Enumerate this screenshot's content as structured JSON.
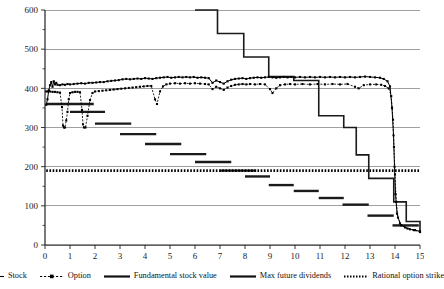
{
  "chart_data": {
    "type": "line",
    "title": "",
    "xlabel": "",
    "ylabel": "",
    "xlim": [
      0,
      15
    ],
    "ylim": [
      0,
      600
    ],
    "grid": true,
    "x_ticks": [
      0,
      1,
      2,
      3,
      4,
      5,
      6,
      7,
      8,
      9,
      10,
      11,
      12,
      13,
      14,
      15
    ],
    "x_tick_labels": [
      "0",
      "1",
      "2",
      "3",
      "4",
      "5",
      "6",
      "7",
      "8",
      "9",
      "10",
      "11",
      "12",
      "13",
      "14",
      "15"
    ],
    "y_ticks": [
      0,
      100,
      200,
      300,
      400,
      500,
      600
    ],
    "y_tick_labels": [
      "0",
      "100",
      "200",
      "300",
      "400",
      "500",
      "600"
    ],
    "y_minor_ticks": [
      50,
      150,
      250,
      350,
      450,
      550
    ],
    "legend_position": "below",
    "series": [
      {
        "name": "Stock",
        "style": "solid-with-markers",
        "color": "#000000",
        "points": [
          [
            0.05,
            358
          ],
          [
            0.1,
            372
          ],
          [
            0.15,
            395
          ],
          [
            0.2,
            408
          ],
          [
            0.25,
            416
          ],
          [
            0.3,
            404
          ],
          [
            0.35,
            418
          ],
          [
            0.4,
            410
          ],
          [
            0.45,
            414
          ],
          [
            0.5,
            409
          ],
          [
            0.6,
            408
          ],
          [
            0.7,
            410
          ],
          [
            0.8,
            409
          ],
          [
            0.9,
            411
          ],
          [
            1.0,
            410
          ],
          [
            1.15,
            411
          ],
          [
            1.3,
            412
          ],
          [
            1.45,
            413
          ],
          [
            1.6,
            412
          ],
          [
            1.75,
            414
          ],
          [
            1.9,
            414
          ],
          [
            2.05,
            415
          ],
          [
            2.2,
            416
          ],
          [
            2.35,
            416
          ],
          [
            2.5,
            418
          ],
          [
            2.65,
            419
          ],
          [
            2.8,
            420
          ],
          [
            2.95,
            421
          ],
          [
            3.1,
            423
          ],
          [
            3.25,
            424
          ],
          [
            3.4,
            423
          ],
          [
            3.55,
            424
          ],
          [
            3.7,
            425
          ],
          [
            3.85,
            424
          ],
          [
            4.0,
            426
          ],
          [
            4.15,
            425
          ],
          [
            4.3,
            424
          ],
          [
            4.45,
            426
          ],
          [
            4.6,
            427
          ],
          [
            4.75,
            428
          ],
          [
            4.9,
            429
          ],
          [
            5.05,
            427
          ],
          [
            5.2,
            428
          ],
          [
            5.35,
            429
          ],
          [
            5.5,
            428
          ],
          [
            5.65,
            429
          ],
          [
            5.8,
            428
          ],
          [
            5.95,
            429
          ],
          [
            6.1,
            427
          ],
          [
            6.25,
            428
          ],
          [
            6.4,
            427
          ],
          [
            6.55,
            426
          ],
          [
            6.7,
            414
          ],
          [
            6.85,
            420
          ],
          [
            7.0,
            416
          ],
          [
            7.15,
            412
          ],
          [
            7.3,
            418
          ],
          [
            7.45,
            422
          ],
          [
            7.6,
            424
          ],
          [
            7.75,
            425
          ],
          [
            7.9,
            426
          ],
          [
            8.05,
            424
          ],
          [
            8.2,
            426
          ],
          [
            8.35,
            427
          ],
          [
            8.5,
            428
          ],
          [
            8.65,
            427
          ],
          [
            8.8,
            428
          ],
          [
            8.95,
            429
          ],
          [
            9.1,
            428
          ],
          [
            9.25,
            427
          ],
          [
            9.4,
            428
          ],
          [
            9.55,
            429
          ],
          [
            9.7,
            428
          ],
          [
            9.85,
            429
          ],
          [
            10.0,
            428
          ],
          [
            10.2,
            429
          ],
          [
            10.4,
            428
          ],
          [
            10.6,
            429
          ],
          [
            10.8,
            428
          ],
          [
            11.0,
            429
          ],
          [
            11.2,
            428
          ],
          [
            11.4,
            429
          ],
          [
            11.6,
            428
          ],
          [
            11.8,
            429
          ],
          [
            12.0,
            428
          ],
          [
            12.2,
            429
          ],
          [
            12.4,
            428
          ],
          [
            12.6,
            429
          ],
          [
            12.8,
            430
          ],
          [
            13.0,
            429
          ],
          [
            13.2,
            428
          ],
          [
            13.4,
            427
          ],
          [
            13.55,
            424
          ],
          [
            13.7,
            418
          ],
          [
            13.8,
            405
          ],
          [
            13.88,
            350
          ],
          [
            13.94,
            280
          ],
          [
            13.98,
            200
          ],
          [
            14.02,
            130
          ],
          [
            14.08,
            80
          ],
          [
            14.2,
            55
          ],
          [
            14.4,
            45
          ],
          [
            14.6,
            40
          ],
          [
            14.8,
            38
          ],
          [
            15.0,
            35
          ]
        ]
      },
      {
        "name": "Option",
        "style": "dashed-with-markers",
        "color": "#000000",
        "points": [
          [
            0.05,
            392
          ],
          [
            0.12,
            392
          ],
          [
            0.2,
            392
          ],
          [
            0.3,
            391
          ],
          [
            0.4,
            391
          ],
          [
            0.5,
            390
          ],
          [
            0.6,
            389
          ],
          [
            0.68,
            352
          ],
          [
            0.72,
            305
          ],
          [
            0.76,
            300
          ],
          [
            0.8,
            300
          ],
          [
            0.85,
            318
          ],
          [
            0.9,
            340
          ],
          [
            0.95,
            372
          ],
          [
            1.0,
            388
          ],
          [
            1.1,
            390
          ],
          [
            1.2,
            391
          ],
          [
            1.3,
            391
          ],
          [
            1.4,
            390
          ],
          [
            1.48,
            345
          ],
          [
            1.52,
            308
          ],
          [
            1.56,
            300
          ],
          [
            1.62,
            300
          ],
          [
            1.7,
            330
          ],
          [
            1.8,
            370
          ],
          [
            1.9,
            388
          ],
          [
            2.0,
            392
          ],
          [
            2.15,
            393
          ],
          [
            2.3,
            394
          ],
          [
            2.45,
            395
          ],
          [
            2.6,
            396
          ],
          [
            2.75,
            397
          ],
          [
            2.9,
            398
          ],
          [
            3.05,
            399
          ],
          [
            3.2,
            400
          ],
          [
            3.35,
            401
          ],
          [
            3.5,
            402
          ],
          [
            3.65,
            403
          ],
          [
            3.8,
            404
          ],
          [
            3.95,
            405
          ],
          [
            4.1,
            406
          ],
          [
            4.25,
            406
          ],
          [
            4.4,
            372
          ],
          [
            4.48,
            360
          ],
          [
            4.6,
            392
          ],
          [
            4.72,
            405
          ],
          [
            4.85,
            410
          ],
          [
            5.0,
            412
          ],
          [
            5.2,
            413
          ],
          [
            5.4,
            412
          ],
          [
            5.6,
            413
          ],
          [
            5.8,
            412
          ],
          [
            6.0,
            413
          ],
          [
            6.2,
            412
          ],
          [
            6.4,
            411
          ],
          [
            6.55,
            410
          ],
          [
            6.7,
            398
          ],
          [
            6.85,
            404
          ],
          [
            7.0,
            400
          ],
          [
            7.15,
            396
          ],
          [
            7.3,
            402
          ],
          [
            7.45,
            406
          ],
          [
            7.6,
            409
          ],
          [
            7.75,
            410
          ],
          [
            7.9,
            411
          ],
          [
            8.05,
            410
          ],
          [
            8.2,
            411
          ],
          [
            8.4,
            410
          ],
          [
            8.6,
            411
          ],
          [
            8.8,
            410
          ],
          [
            9.0,
            398
          ],
          [
            9.1,
            388
          ],
          [
            9.25,
            400
          ],
          [
            9.4,
            408
          ],
          [
            9.6,
            410
          ],
          [
            9.8,
            411
          ],
          [
            10.0,
            410
          ],
          [
            10.3,
            411
          ],
          [
            10.6,
            410
          ],
          [
            10.9,
            411
          ],
          [
            11.2,
            410
          ],
          [
            11.5,
            411
          ],
          [
            11.8,
            410
          ],
          [
            12.1,
            411
          ],
          [
            12.4,
            404
          ],
          [
            12.55,
            400
          ],
          [
            12.75,
            408
          ],
          [
            13.0,
            410
          ],
          [
            13.25,
            410
          ],
          [
            13.45,
            409
          ],
          [
            13.6,
            406
          ],
          [
            13.75,
            400
          ],
          [
            13.85,
            380
          ],
          [
            13.92,
            320
          ],
          [
            13.96,
            250
          ],
          [
            14.0,
            180
          ],
          [
            14.05,
            110
          ],
          [
            14.12,
            70
          ],
          [
            14.25,
            50
          ],
          [
            14.5,
            42
          ],
          [
            14.75,
            38
          ],
          [
            15.0,
            33
          ]
        ]
      }
    ],
    "step_series": {
      "name": "Fundamental stock value",
      "style": "solid-step",
      "color": "#1a1a1a",
      "steps": [
        [
          6.0,
          600
        ],
        [
          6.9,
          600
        ],
        [
          6.9,
          540
        ],
        [
          7.95,
          540
        ],
        [
          7.95,
          480
        ],
        [
          8.95,
          480
        ],
        [
          8.95,
          430
        ],
        [
          9.95,
          430
        ],
        [
          9.95,
          420
        ],
        [
          10.95,
          420
        ],
        [
          10.95,
          330
        ],
        [
          11.95,
          330
        ],
        [
          11.95,
          300
        ],
        [
          12.45,
          300
        ],
        [
          12.45,
          230
        ],
        [
          12.95,
          230
        ],
        [
          12.95,
          170
        ],
        [
          13.95,
          170
        ],
        [
          13.95,
          110
        ],
        [
          14.45,
          110
        ],
        [
          14.45,
          60
        ],
        [
          15.0,
          60
        ],
        [
          15.0,
          35
        ]
      ]
    },
    "dividend_bars": {
      "name": "Max future dividends",
      "style": "horizontal-segments",
      "color": "#1a1a1a",
      "segments": [
        {
          "x0": 0.05,
          "x1": 1.95,
          "y": 360
        },
        {
          "x0": 1.0,
          "x1": 2.4,
          "y": 340
        },
        {
          "x0": 2.0,
          "x1": 3.45,
          "y": 310
        },
        {
          "x0": 3.0,
          "x1": 4.45,
          "y": 283
        },
        {
          "x0": 4.0,
          "x1": 5.45,
          "y": 258
        },
        {
          "x0": 5.0,
          "x1": 6.45,
          "y": 232
        },
        {
          "x0": 6.0,
          "x1": 7.45,
          "y": 212
        },
        {
          "x0": 7.0,
          "x1": 8.45,
          "y": 190
        },
        {
          "x0": 8.0,
          "x1": 9.0,
          "y": 175
        },
        {
          "x0": 8.95,
          "x1": 9.95,
          "y": 153
        },
        {
          "x0": 9.95,
          "x1": 10.95,
          "y": 138
        },
        {
          "x0": 10.95,
          "x1": 11.95,
          "y": 120
        },
        {
          "x0": 11.9,
          "x1": 12.95,
          "y": 103
        },
        {
          "x0": 12.9,
          "x1": 13.95,
          "y": 75
        },
        {
          "x0": 13.9,
          "x1": 14.95,
          "y": 50
        }
      ]
    },
    "strike_line": {
      "name": "Rational option strike",
      "style": "dotted",
      "color": "#000000",
      "y": 190,
      "x0": 0.05,
      "x1": 15.0
    }
  },
  "legend": {
    "items": [
      {
        "label": "Stock",
        "marker": "solid-line-with-square-marker"
      },
      {
        "label": "Option",
        "marker": "dashed-line-with-square-marker"
      },
      {
        "label": "Fundamental stock value",
        "marker": "thick-solid-line"
      },
      {
        "label": "Max future dividends",
        "marker": "thick-solid-line"
      },
      {
        "label": "Rational option strike",
        "marker": "dotted-line"
      }
    ]
  }
}
